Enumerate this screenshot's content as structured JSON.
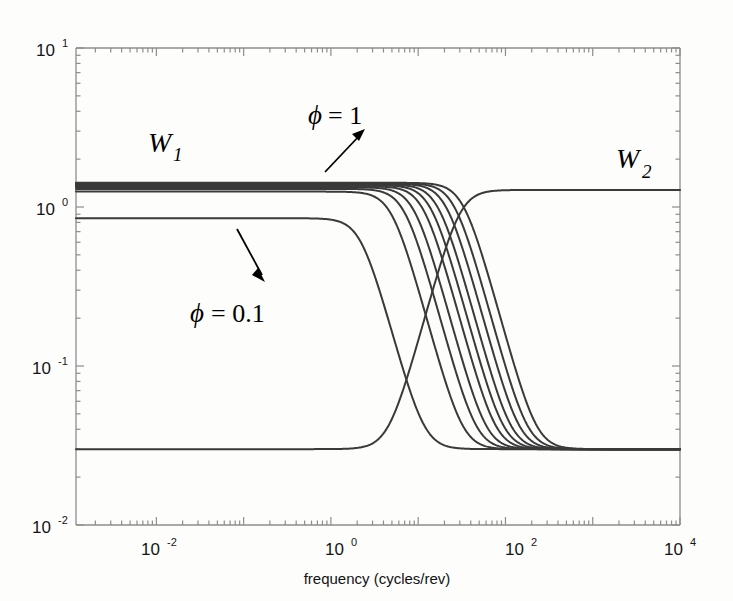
{
  "figure": {
    "background_color": "#fdfdfc",
    "line_color": "#3a3a3a",
    "axis_color": "#7a7a7a",
    "text_color": "#151515"
  },
  "chart_data": {
    "type": "line",
    "title": "",
    "xlabel": "frequency (cycles/rev)",
    "ylabel": "",
    "xscale": "log",
    "yscale": "log",
    "xlim": [
      0.0012,
      10000
    ],
    "ylim": [
      0.01,
      10
    ],
    "xticks": [
      0.01,
      1,
      100,
      10000
    ],
    "xtick_labels": [
      "10-2",
      "100",
      "102",
      "104"
    ],
    "xtick_mantissa": [
      "10",
      "10",
      "10",
      "10"
    ],
    "xtick_exponents": [
      "-2",
      "0",
      "2",
      "4"
    ],
    "yticks": [
      0.01,
      0.1,
      1,
      10
    ],
    "ytick_mantissa": [
      "10",
      "10",
      "10",
      "10"
    ],
    "ytick_exponents": [
      "-2",
      "-1",
      "0",
      "1"
    ],
    "grid": false,
    "legend": "none",
    "annotations": [
      {
        "name": "w1-label",
        "text": "W",
        "sub": "1",
        "x_px": 148,
        "y_px": 152
      },
      {
        "name": "w2-label",
        "text": "W",
        "sub": "2",
        "x_px": 616,
        "y_px": 168
      },
      {
        "name": "phi-high-label",
        "text": "= 1",
        "symbol": "f",
        "x_px": 310,
        "y_px": 124,
        "arrow": {
          "x1": 325,
          "y1": 172,
          "x2": 360,
          "y2": 133
        }
      },
      {
        "name": "phi-low-label",
        "text": "= 0.1",
        "symbol": "f",
        "x_px": 192,
        "y_px": 322,
        "arrow": {
          "x1": 238,
          "y1": 230,
          "x2": 264,
          "y2": 278
        }
      }
    ],
    "series_description": "W1 family: ten low-pass weighting curves with DC gains from 0.85 to 1.42 and corner frequencies sweeping with phi from 0.1 to 1; W2: single high-pass weighting curve rising from 0.030 to 1.28",
    "w1_family": {
      "name": "W1",
      "phi_values": [
        0.1,
        0.2,
        0.3,
        0.4,
        0.5,
        0.6,
        0.7,
        0.8,
        0.9,
        1.0
      ],
      "dc_gain": [
        0.85,
        1.25,
        1.3,
        1.33,
        1.35,
        1.37,
        1.385,
        1.4,
        1.41,
        1.42
      ],
      "hf_gain": 0.03,
      "corner_freq": [
        2.2,
        5.0,
        7.0,
        9.0,
        11.5,
        14.0,
        17.0,
        21.0,
        26.0,
        33.0
      ],
      "rolloff_order": 2
    },
    "w2_series": {
      "name": "W2",
      "low_gain": 0.03,
      "high_gain": 1.28,
      "corner_freq": 30.0,
      "rolloff_order": 2
    }
  },
  "axis_label": {
    "x_title": "frequency (cycles/rev)"
  }
}
